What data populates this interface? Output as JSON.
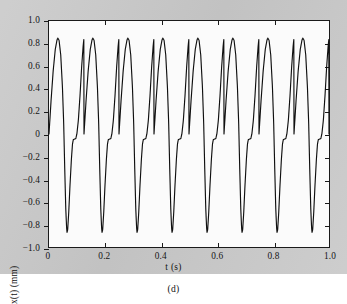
{
  "figure": {
    "panel_caption": "(d)",
    "background_color": "#c9c9c9",
    "plot_background_color": "#fbfbfb",
    "curve_color": "#101010"
  },
  "chart_data": {
    "type": "line",
    "title": "",
    "xlabel": "t (s)",
    "ylabel": "x(t) (mm)",
    "xlim": [
      0,
      1.0
    ],
    "ylim": [
      -1.0,
      1.0
    ],
    "xticks": [
      0,
      0.2,
      0.4,
      0.6,
      0.8,
      1.0
    ],
    "xtick_labels": [
      "0",
      "0.2",
      "0.4",
      "0.6",
      "0.8",
      "1.0"
    ],
    "yticks": [
      -1.0,
      -0.8,
      -0.6,
      -0.4,
      -0.2,
      0,
      0.2,
      0.4,
      0.6,
      0.8,
      1.0
    ],
    "ytick_labels": [
      "−1.0",
      "−0.8",
      "−0.6",
      "−0.4",
      "−0.2",
      "0",
      "0.2",
      "0.4",
      "0.6",
      "0.8",
      "1.0"
    ],
    "grid": false,
    "legend": null,
    "series": [
      {
        "name": "x(t)",
        "description": "Non-sinusoidal periodic steady-state vibration response; narrow positive peaks near 0.85 mm, narrow negative troughs near -0.87 mm, with a shoulder/plateau near -0.05 mm on each rising edge.",
        "period_s": 0.125,
        "frequency_hz": 8,
        "cycles_shown": 8,
        "peak_value": 0.85,
        "trough_value": -0.87,
        "shoulder_value": -0.05,
        "peak_times": [
          0.042,
          0.167,
          0.292,
          0.417,
          0.542,
          0.667,
          0.792,
          0.917
        ],
        "trough_times": [
          0.086,
          0.211,
          0.336,
          0.461,
          0.586,
          0.711,
          0.836,
          0.961
        ],
        "start_value": 0.02,
        "end_value": -0.12,
        "cycle_shape": [
          [
            0.0,
            0.0
          ],
          [
            0.01,
            0.3
          ],
          [
            0.02,
            0.56
          ],
          [
            0.03,
            0.75
          ],
          [
            0.038,
            0.83
          ],
          [
            0.042,
            0.85
          ],
          [
            0.048,
            0.83
          ],
          [
            0.056,
            0.7
          ],
          [
            0.064,
            0.42
          ],
          [
            0.07,
            0.1
          ],
          [
            0.075,
            -0.3
          ],
          [
            0.08,
            -0.66
          ],
          [
            0.084,
            -0.83
          ],
          [
            0.086,
            -0.87
          ],
          [
            0.089,
            -0.85
          ],
          [
            0.094,
            -0.7
          ],
          [
            0.1,
            -0.46
          ],
          [
            0.107,
            -0.22
          ],
          [
            0.112,
            -0.09
          ],
          [
            0.116,
            -0.05
          ],
          [
            0.122,
            -0.045
          ],
          [
            0.128,
            -0.04
          ],
          [
            0.133,
            0.0
          ],
          [
            0.14,
            0.12
          ],
          [
            0.148,
            0.34
          ],
          [
            0.156,
            0.6
          ],
          [
            0.163,
            0.78
          ],
          [
            0.167,
            0.85
          ]
        ]
      }
    ]
  }
}
